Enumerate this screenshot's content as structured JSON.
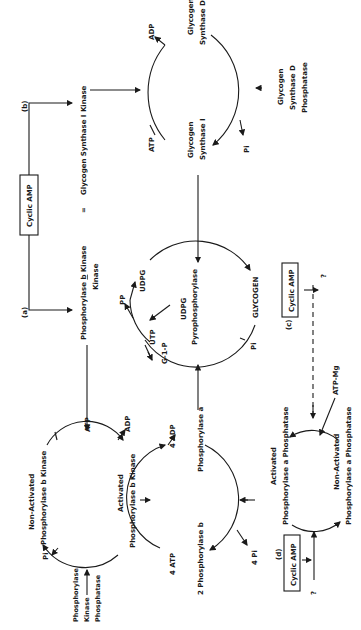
{
  "figure": {
    "orientation": "rotated 90 degrees counter-clockwise",
    "pathways": {
      "a": {
        "label": "(a)",
        "trigger": "Cyclic AMP",
        "enzyme": "Phosphorylase b Kinase Kinase",
        "enzyme_line1": "Phosphorylase",
        "enzyme_b": "b",
        "enzyme_line1_end": "Kinase",
        "enzyme_line2": "Kinase"
      },
      "b": {
        "label": "(b)",
        "enzyme": "Glycogen Synthase I Kinase",
        "equals": "="
      },
      "c": {
        "label": "(c)",
        "trigger": "Cyclic AMP",
        "question": "?"
      },
      "d": {
        "label": "(d)",
        "trigger": "Cyclic AMP",
        "question": "?"
      }
    },
    "cycles": {
      "kinase_cycle": {
        "non_activated_1": "Non-Activated",
        "non_activated_2": "Phosphorylase b Kinase",
        "activated_1": "Activated",
        "activated_2": "Phosphorylase b Kinase",
        "atp": "ATP",
        "adp": "ADP",
        "pi": "Pi",
        "phosphatase_1": "Phosphorylase",
        "phosphatase_2": "Kinase",
        "phosphatase_3": "Phosphatase"
      },
      "phosphorylase_cycle": {
        "phos_a": "Phosphorylase a",
        "phos_b": "2 Phosphorylase b",
        "atp": "4 ATP",
        "adp": "4 ADP",
        "pi": "4 Pi"
      },
      "glycogen_cycle": {
        "udpg": "UDPG",
        "enzyme_1": "UDPG",
        "enzyme_2": "Pyrophosphorylase",
        "glycogen": "GLYCOGEN",
        "pi": "Pi",
        "pp": "PP",
        "utp": "UTP",
        "g1p": "G-1-P"
      },
      "synthase_cycle": {
        "synthase_d_1": "Glycogen",
        "synthase_d_2": "Synthase D",
        "synthase_i_1": "Glycogen",
        "synthase_i_2": "Synthase I",
        "atp": "ATP",
        "adp": "ADP",
        "pi": "Pi",
        "phosphatase_1": "Glycogen",
        "phosphatase_2": "Synthase D",
        "phosphatase_3": "Phosphatase"
      },
      "phosphatase_cycle": {
        "activated_1": "Activated",
        "activated_2": "Phosphorylase a Phosphatase",
        "non_activated_1": "Non-Activated",
        "non_activated_2": "Phosphorylase a Phosphatase",
        "atp_mg": "ATP-Mg"
      }
    }
  }
}
